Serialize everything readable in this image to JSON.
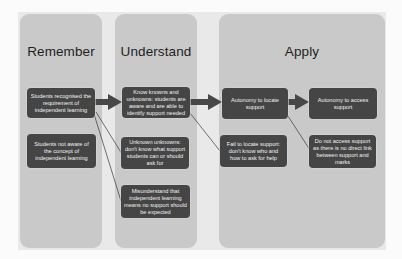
{
  "diagram": {
    "colors": {
      "panel": "#c9c9c9",
      "node": "#454545",
      "node_text": "#f2f2f2",
      "arrow": "#474747",
      "connector": "#3a3a3a"
    },
    "columns": [
      {
        "title": "Remember",
        "nodes": [
          "Students recognised the requirement of independent learning",
          "Students not aware of the concept of independent learning"
        ]
      },
      {
        "title": "Understand",
        "nodes": [
          "Know knowns and unknowns: students are aware and are able to identify support needed",
          "Unknown unknowns: don't know what support students can or should ask for",
          "Misunderstand that independent learning means no support should be expected"
        ]
      },
      {
        "title": "Apply",
        "nodes": [
          "Autonomy to locate support",
          "Autonomy to access support",
          "Fail to locate support: don't know who and how to ask for help",
          "Do not access support as there is no direct link between support and marks"
        ]
      }
    ],
    "edges": [
      {
        "from": "Students recognised the requirement of independent learning",
        "to": "Know knowns and unknowns: students are aware and are able to identify support needed",
        "style": "thick-arrow"
      },
      {
        "from": "Students recognised the requirement of independent learning",
        "to": "Unknown unknowns: don't know what support students can or should ask for",
        "style": "thin-line"
      },
      {
        "from": "Students recognised the requirement of independent learning",
        "to": "Misunderstand that independent learning means no support should be expected",
        "style": "thin-line"
      },
      {
        "from": "Know knowns and unknowns: students are aware and are able to identify support needed",
        "to": "Autonomy to locate support",
        "style": "thick-arrow"
      },
      {
        "from": "Know knowns and unknowns: students are aware and are able to identify support needed",
        "to": "Fail to locate support: don't know who and how to ask for help",
        "style": "thin-line"
      },
      {
        "from": "Autonomy to locate support",
        "to": "Autonomy to access support",
        "style": "thick-arrow"
      },
      {
        "from": "Autonomy to locate support",
        "to": "Do not access support as there is no direct link between support and marks",
        "style": "thin-line"
      }
    ]
  }
}
